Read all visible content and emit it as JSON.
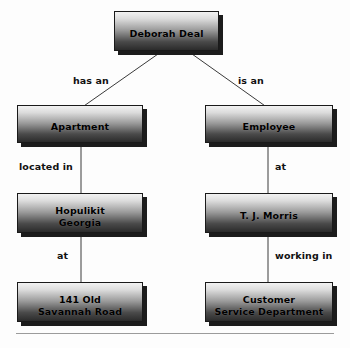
{
  "diagram": {
    "type": "tree",
    "nodes": [
      {
        "id": "root",
        "label": "Deborah Deal",
        "lines": [
          "Deborah Deal"
        ]
      },
      {
        "id": "apartment",
        "label": "Apartment",
        "lines": [
          "Apartment"
        ]
      },
      {
        "id": "employee",
        "label": "Employee",
        "lines": [
          "Employee"
        ]
      },
      {
        "id": "city",
        "label": "Hopulikit Georgia",
        "lines": [
          "Hopulikit",
          "Georgia"
        ]
      },
      {
        "id": "company",
        "label": "T. J. Morris",
        "lines": [
          "T. J. Morris"
        ]
      },
      {
        "id": "address",
        "label": "141 Old Savannah Road",
        "lines": [
          "141 Old",
          "Savannah Road"
        ]
      },
      {
        "id": "department",
        "label": "Customer Service Department",
        "lines": [
          "Customer",
          "Service Department"
        ]
      }
    ],
    "edges": [
      {
        "from": "root",
        "to": "apartment",
        "label": "has an"
      },
      {
        "from": "root",
        "to": "employee",
        "label": "is an"
      },
      {
        "from": "apartment",
        "to": "city",
        "label": "located in"
      },
      {
        "from": "employee",
        "to": "company",
        "label": "at"
      },
      {
        "from": "city",
        "to": "address",
        "label": "at"
      },
      {
        "from": "company",
        "to": "department",
        "label": "working in"
      }
    ],
    "colors": {
      "box_border": "#1a1a1a",
      "box_shadow": "#1c1c1c",
      "gradient_top": "#f2f2f2",
      "gradient_bottom": "#2b2b2b",
      "text": "#000000",
      "connector": "#3a3a3a",
      "rule": "#9b9b9b",
      "background": "#fdfdfd"
    }
  }
}
